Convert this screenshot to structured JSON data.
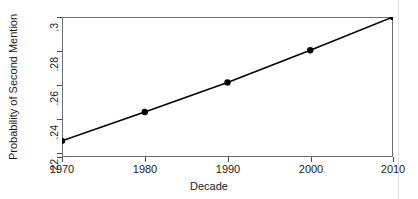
{
  "chart_data": {
    "type": "line",
    "title": "",
    "xlabel": "Decade",
    "ylabel": "Probability of Second Mention",
    "x": [
      1970,
      1980,
      1990,
      2000,
      2010
    ],
    "values": [
      0.2253,
      0.2428,
      0.2608,
      0.2803,
      0.3005
    ],
    "series": [
      {
        "name": "Probability of Second Mention",
        "values": [
          0.2253,
          0.2428,
          0.2608,
          0.2803,
          0.3005
        ]
      }
    ],
    "xticklabels": [
      "1970",
      "1980",
      "1990",
      "2000",
      "2010"
    ],
    "yticks": [
      0.22,
      0.24,
      0.26,
      0.28,
      0.3
    ],
    "yticklabels": [
      ".22",
      ".24",
      ".26",
      ".28",
      ".3"
    ],
    "xlim": [
      1970,
      2010
    ],
    "ylim": [
      0.2155,
      0.3005
    ],
    "grid": false,
    "legend": false,
    "legend_position": "none",
    "marker": "filled-circle",
    "line_color": "#000000",
    "marker_color": "#000000",
    "frame_color": "#6e6e6e",
    "background_color": "#ffffff"
  }
}
